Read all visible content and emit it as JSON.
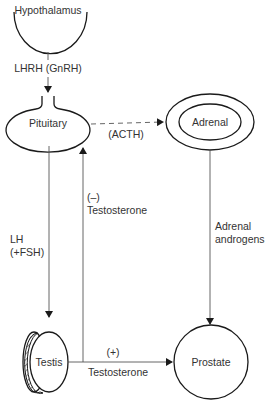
{
  "diagram": {
    "nodes": {
      "hypothalamus": "Hypothalamus",
      "pituitary": "Pituitary",
      "adrenal": "Adrenal",
      "testis": "Testis",
      "prostate": "Prostate"
    },
    "edges": {
      "lhrh": "LHRH (GnRH)",
      "acth": "(ACTH)",
      "lh_line1": "LH",
      "lh_line2": "(+FSH)",
      "neg_sign": "(–)",
      "neg_testosterone": "Testosterone",
      "adrenal_line1": "Adrenal",
      "adrenal_line2": "androgens",
      "pos_sign": "(+)",
      "pos_testosterone": "Testosterone"
    },
    "colors": {
      "line": "#1a1a1a",
      "text": "#333333",
      "background": "#ffffff"
    }
  }
}
